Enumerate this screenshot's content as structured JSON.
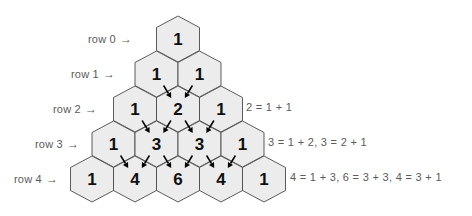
{
  "figure": {
    "colors": {
      "hex_fill": "#ececec",
      "hex_stroke": "#4a4a4a",
      "number_color": "#101010",
      "label_color": "#5b5b5b",
      "arrow_color": "#000000",
      "background": "#ffffff"
    }
  },
  "row_labels": [
    {
      "text": "row 0",
      "arrow": "→",
      "x": 88,
      "y": 32
    },
    {
      "text": "row 1",
      "arrow": "→",
      "x": 71,
      "y": 67
    },
    {
      "text": "row 2",
      "arrow": "→",
      "x": 53,
      "y": 102
    },
    {
      "text": "row 3",
      "arrow": "→",
      "x": 35,
      "y": 137
    },
    {
      "text": "row 4",
      "arrow": "→",
      "x": 14,
      "y": 172
    }
  ],
  "equations": [
    {
      "text": "2 = 1 + 1",
      "x": 246,
      "y": 101
    },
    {
      "text": "3 = 1 + 2,  3 = 2 + 1",
      "x": 268,
      "y": 136
    },
    {
      "text": "4 = 1 + 3,  6 = 3 + 3,  4 = 3 + 1",
      "x": 290,
      "y": 171
    }
  ],
  "chart_data": {
    "type": "table",
    "row_labels": [
      "row 0",
      "row 1",
      "row 2",
      "row 3",
      "row 4"
    ],
    "rows": [
      [
        1
      ],
      [
        1,
        1
      ],
      [
        1,
        2,
        1
      ],
      [
        1,
        3,
        3,
        1
      ],
      [
        1,
        4,
        6,
        4,
        1
      ]
    ],
    "annotations": [
      "2 = 1 + 1",
      "3 = 1 + 2,  3 = 2 + 1",
      "4 = 1 + 3,  6 = 3 + 3,  4 = 3 + 1"
    ],
    "geometry": {
      "hex_width": 43,
      "hex_height": 46,
      "row_pitch_y": 35,
      "col_pitch_x": 43,
      "apex_center_x": 178,
      "row0_center_y": 39
    },
    "arrows_note": "Each interior cell receives two arrows, one from each parent above it; outer cells of value 1 receive none."
  }
}
